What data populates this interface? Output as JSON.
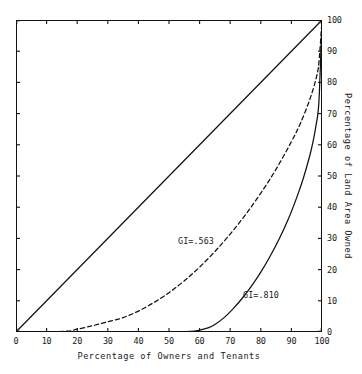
{
  "chart_data": {
    "type": "line",
    "title": "",
    "xlabel": "Percentage of Owners and Tenants",
    "ylabel": "Percentage of Land Area Owned",
    "xlim": [
      0,
      100
    ],
    "ylim": [
      0,
      100
    ],
    "grid": false,
    "legend_position": "inline-annotations",
    "xticks": [
      "0",
      "10",
      "20",
      "30",
      "40",
      "50",
      "60",
      "70",
      "80",
      "90",
      "100"
    ],
    "yticks": [
      "0",
      "10",
      "20",
      "30",
      "40",
      "50",
      "60",
      "70",
      "80",
      "90",
      "100"
    ],
    "ytick_side": "right",
    "annotations": [
      {
        "text": "GI=.563",
        "x": 53,
        "y": 31
      },
      {
        "text": "GI=.810",
        "x": 74,
        "y": 14
      }
    ],
    "series": [
      {
        "name": "Line of equality",
        "style": "solid",
        "color": "#111111",
        "x": [
          0,
          100
        ],
        "values": [
          0,
          100
        ]
      },
      {
        "name": "GI=.563",
        "style": "dashed",
        "color": "#111111",
        "x": [
          0,
          10,
          17,
          20,
          25,
          30,
          35,
          40,
          45,
          50,
          55,
          60,
          65,
          70,
          75,
          80,
          85,
          90,
          93,
          96,
          98,
          99,
          100
        ],
        "values": [
          0,
          0,
          0.3,
          0.9,
          2.0,
          3.3,
          4.6,
          6.7,
          9.4,
          12.6,
          16.4,
          20.8,
          25.8,
          31.4,
          37.6,
          44.5,
          52.2,
          61.0,
          67.0,
          74.5,
          81.0,
          86.5,
          100
        ]
      },
      {
        "name": "GI=.810",
        "style": "solid",
        "color": "#111111",
        "x": [
          0,
          20,
          40,
          50,
          57,
          60,
          63,
          65,
          68,
          71,
          74,
          77,
          80,
          83,
          86,
          89,
          92,
          94,
          96,
          97,
          98,
          99,
          100
        ],
        "values": [
          0,
          0,
          0,
          0,
          0.2,
          0.6,
          1.4,
          2.4,
          4.6,
          7.5,
          10.9,
          14.8,
          19.2,
          24.2,
          29.8,
          36.2,
          43.8,
          49.6,
          56.5,
          60.7,
          66.0,
          74.0,
          100
        ]
      }
    ]
  }
}
